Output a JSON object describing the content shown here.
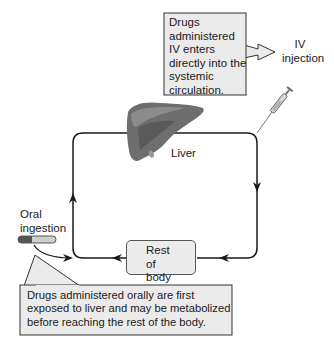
{
  "diagram": {
    "type": "flow-cycle",
    "topic": "First-pass metabolism: IV vs oral drug administration",
    "callouts": {
      "iv_note": "Drugs administered IV enters directly into the systemic circulation.",
      "oral_note": "Drugs administered orally are first exposed to liver and may be metabolized before reaching the rest of the body."
    },
    "nodes": {
      "iv_injection": "IV injection",
      "liver": "Liver",
      "rest_of_body": "Rest of body",
      "oral_ingestion": "Oral ingestion"
    },
    "icons": [
      "liver-illustration",
      "syringe-icon",
      "capsule-icon"
    ],
    "edges": [
      {
        "from": "liver",
        "to": "rest_of_body",
        "path": "right side, downward"
      },
      {
        "from": "rest_of_body",
        "to": "liver",
        "path": "bottom leftward then left side upward"
      },
      {
        "from": "iv_injection",
        "to": "circulation",
        "path": "enters at top-right corner"
      },
      {
        "from": "oral_ingestion",
        "to": "liver",
        "path": "enters at bottom-left corner"
      }
    ],
    "colors": {
      "line": "#1a1a1a",
      "callout_fill": "#ebebeb",
      "box_fill": "#ececec",
      "liver": "#6e6e6e"
    }
  }
}
